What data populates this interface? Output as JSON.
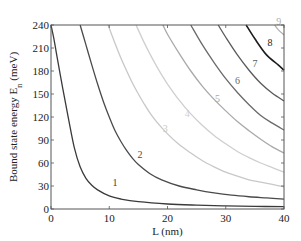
{
  "chart_data": {
    "type": "line",
    "title": "",
    "xlabel": "L (nm)",
    "ylabel": "Bound state energy E_n (meV)",
    "ylabel_main": "Bound state energy E",
    "ylabel_sub": "n",
    "ylabel_unit": " (meV)",
    "xlim": [
      0,
      40
    ],
    "ylim": [
      0,
      240
    ],
    "xticks": [
      0,
      10,
      20,
      30,
      40
    ],
    "yticks": [
      0,
      30,
      60,
      90,
      120,
      150,
      180,
      210,
      240
    ],
    "grid": false,
    "legend": "none (inline curve labels 1-9)",
    "series": [
      {
        "name": "1",
        "color": "#3a3a3a",
        "label_pos": [
          11.0,
          30
        ],
        "points": [
          [
            0,
            240
          ],
          [
            0.5,
            222
          ],
          [
            1,
            200
          ],
          [
            2,
            158
          ],
          [
            3,
            118
          ],
          [
            4,
            80
          ],
          [
            5,
            55
          ],
          [
            6,
            40
          ],
          [
            7,
            31
          ],
          [
            8,
            25
          ],
          [
            10,
            17
          ],
          [
            12,
            13
          ],
          [
            15,
            9.5
          ],
          [
            20,
            6.5
          ],
          [
            25,
            5
          ],
          [
            30,
            4
          ],
          [
            35,
            3.4
          ],
          [
            40,
            3
          ]
        ]
      },
      {
        "name": "2",
        "color": "#4a4a4a",
        "label_pos": [
          15.3,
          66
        ],
        "points": [
          [
            5,
            240
          ],
          [
            6,
            214
          ],
          [
            7,
            188
          ],
          [
            8,
            163
          ],
          [
            9,
            140
          ],
          [
            10,
            120
          ],
          [
            11,
            102
          ],
          [
            12,
            88
          ],
          [
            13,
            76
          ],
          [
            14,
            66
          ],
          [
            15,
            58
          ],
          [
            17,
            46
          ],
          [
            19,
            38
          ],
          [
            22,
            30
          ],
          [
            25,
            25
          ],
          [
            28,
            21
          ],
          [
            31,
            18
          ],
          [
            34,
            16
          ],
          [
            37,
            14.5
          ],
          [
            40,
            13
          ]
        ]
      },
      {
        "name": "3",
        "color": "#c8c8c8",
        "label_pos": [
          19.6,
          100
        ],
        "points": [
          [
            9.8,
            240
          ],
          [
            11,
            216
          ],
          [
            12,
            197
          ],
          [
            13,
            180
          ],
          [
            14,
            164
          ],
          [
            15,
            150
          ],
          [
            16,
            137
          ],
          [
            17,
            125
          ],
          [
            18,
            115
          ],
          [
            20,
            98
          ],
          [
            22,
            84
          ],
          [
            24,
            73
          ],
          [
            26,
            63
          ],
          [
            28,
            55
          ],
          [
            30,
            48
          ],
          [
            32,
            43
          ],
          [
            34,
            38
          ],
          [
            36,
            35
          ],
          [
            38,
            32
          ],
          [
            40,
            29
          ]
        ]
      },
      {
        "name": "4",
        "color": "#cfcfcf",
        "label_pos": [
          23.4,
          120
        ],
        "points": [
          [
            14.6,
            240
          ],
          [
            16,
            217
          ],
          [
            17,
            202
          ],
          [
            18,
            188
          ],
          [
            19,
            175
          ],
          [
            20,
            163
          ],
          [
            22,
            142
          ],
          [
            24,
            124
          ],
          [
            26,
            109
          ],
          [
            28,
            96
          ],
          [
            30,
            85
          ],
          [
            32,
            75
          ],
          [
            34,
            67
          ],
          [
            36,
            60
          ],
          [
            38,
            54
          ],
          [
            40,
            48
          ]
        ]
      },
      {
        "name": "5",
        "color": "#a9a9a9",
        "label_pos": [
          28.6,
          140
        ],
        "points": [
          [
            19.2,
            240
          ],
          [
            20,
            228
          ],
          [
            22,
            203
          ],
          [
            24,
            180
          ],
          [
            26,
            160
          ],
          [
            28,
            143
          ],
          [
            30,
            128
          ],
          [
            32,
            114
          ],
          [
            34,
            102
          ],
          [
            36,
            91
          ],
          [
            38,
            81
          ],
          [
            40,
            73
          ]
        ]
      },
      {
        "name": "6",
        "color": "#6a6a6a",
        "label_pos": [
          32.0,
          163
        ],
        "points": [
          [
            24,
            240
          ],
          [
            26,
            214
          ],
          [
            28,
            191
          ],
          [
            30,
            170
          ],
          [
            32,
            152
          ],
          [
            34,
            136
          ],
          [
            36,
            122
          ],
          [
            38,
            112
          ],
          [
            40,
            103
          ]
        ]
      },
      {
        "name": "7",
        "color": "#5a5a5a",
        "label_pos": [
          35.0,
          185
        ],
        "points": [
          [
            28.7,
            240
          ],
          [
            30,
            224
          ],
          [
            32,
            201
          ],
          [
            34,
            181
          ],
          [
            36,
            164
          ],
          [
            38,
            151
          ],
          [
            40,
            141
          ]
        ]
      },
      {
        "name": "8",
        "color": "#1c1c1c",
        "label_pos": [
          37.6,
          212
        ],
        "points": [
          [
            33.5,
            240
          ],
          [
            35,
            222
          ],
          [
            37,
            201
          ],
          [
            39,
            188
          ],
          [
            40,
            181
          ]
        ]
      },
      {
        "name": "9",
        "color": "#b0b0b0",
        "label_pos": [
          39.1,
          240
        ],
        "points": [
          [
            38.4,
            240
          ],
          [
            39,
            234
          ],
          [
            40,
            227
          ]
        ]
      }
    ]
  }
}
